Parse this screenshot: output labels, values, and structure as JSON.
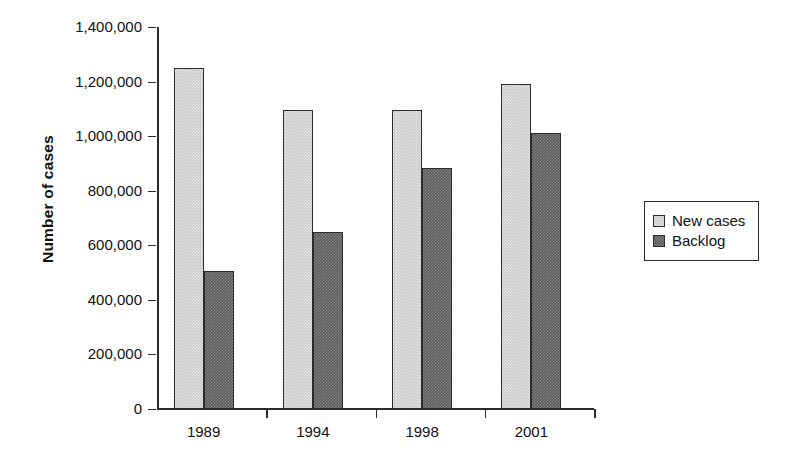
{
  "chart_data": {
    "type": "bar",
    "title": "",
    "subtitle": "",
    "xlabel": "",
    "ylabel": "Number of cases",
    "categories": [
      "1989",
      "1994",
      "1998",
      "2001"
    ],
    "series": [
      {
        "name": "New cases",
        "color": "#c9c9c9",
        "values": [
          1250000,
          1095000,
          1095000,
          1190000
        ]
      },
      {
        "name": "Backlog",
        "color": "#5c5c5c",
        "values": [
          505000,
          650000,
          885000,
          1010000
        ]
      }
    ],
    "ylim": [
      0,
      1400000
    ],
    "ytick_values": [
      1400000,
      1200000,
      1000000,
      800000,
      600000,
      400000,
      200000,
      0
    ],
    "ytick_labels": [
      "1,400,000",
      "1,200,000",
      "1,000,000",
      "800,000",
      "600,000",
      "400,000",
      "200,000",
      "0"
    ],
    "grid": false,
    "legend_position": "right",
    "legend_entries": [
      "New cases",
      "Backlog"
    ],
    "annotations": []
  },
  "axis": {
    "y_title": "Number of cases"
  }
}
